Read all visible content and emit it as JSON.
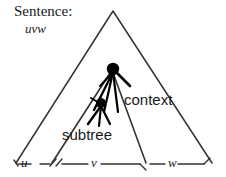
{
  "figure": {
    "title_label": "Sentence:",
    "sentence_string": "uvw",
    "context_label": "context",
    "subtree_label": "subtree",
    "baseline_labels": {
      "left": "u",
      "middle": "v",
      "right": "w"
    },
    "colors": {
      "ink": "#1a1a1a",
      "outline": "#333333",
      "node_fill": "#000000",
      "background": "#ffffff"
    },
    "geometry": {
      "outer_triangle": {
        "apex": [
          113,
          11
        ],
        "bottom_left": [
          16,
          163
        ],
        "bottom_right": [
          212,
          163
        ]
      },
      "inner_triangle": {
        "apex": [
          112,
          70
        ],
        "bottom_left": [
          52,
          163
        ],
        "bottom_right": [
          146,
          163
        ]
      },
      "upper_node": [
        113,
        70
      ],
      "lower_node": [
        101,
        104
      ]
    },
    "icon_names": {
      "outer_region": "outer-triangle-icon",
      "inner_region": "inner-triangle-icon",
      "tree_root": "tree-root-node-icon",
      "subtree_root": "subtree-root-node-icon",
      "baseline_rule": "baseline-rule-icon",
      "tick": "bracket-tick-icon"
    }
  }
}
